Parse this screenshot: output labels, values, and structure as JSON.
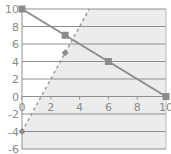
{
  "chart_data": {
    "type": "line",
    "title": "",
    "xlabel": "",
    "ylabel": "",
    "xlim": [
      0,
      10
    ],
    "ylim": [
      -6,
      10
    ],
    "x_ticks": [
      "0",
      "2",
      "4",
      "6",
      "8",
      "10"
    ],
    "y_ticks": [
      "10",
      "8",
      "6",
      "4",
      "2",
      "0",
      "-2",
      "-4",
      "-6"
    ],
    "grid": true,
    "legend": null,
    "series": [
      {
        "name": "y = 10 - x",
        "style": "solid",
        "marker": "square",
        "color": "#8c8c8c",
        "x": [
          0,
          3,
          6,
          10
        ],
        "y": [
          10,
          7,
          4,
          0
        ]
      },
      {
        "name": "y = 3x - 4",
        "style": "dashed",
        "marker": "diamond",
        "color": "#9a9a9a",
        "x": [
          0,
          3,
          4.67
        ],
        "y": [
          -4,
          5,
          10
        ]
      }
    ],
    "shaded_region": {
      "description": "area right of the dashed line shaded light gray",
      "color": "#ececec"
    }
  }
}
